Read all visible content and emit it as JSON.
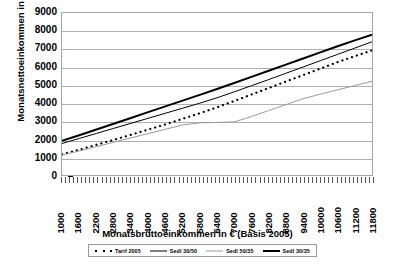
{
  "chart_data": {
    "type": "line",
    "title": "Monatsnettoeinkommen nach Tarifmodellen",
    "xlabel": "Monatsbruttoeinkommen in € (Basis 2005)",
    "ylabel": "Monatsnettoeinkommen in €",
    "ylim": [
      0,
      9000
    ],
    "ytick_step": 1000,
    "yticks": [
      9000,
      8000,
      7000,
      6000,
      5000,
      4000,
      3000,
      2000,
      1000,
      0
    ],
    "grid": true,
    "legend_position": "bottom",
    "categories": [
      1000,
      1600,
      2200,
      2800,
      3400,
      4000,
      4600,
      5200,
      5800,
      6400,
      7000,
      7600,
      8200,
      8800,
      9400,
      10000,
      10600,
      11200,
      11800
    ],
    "series": [
      {
        "name": "Tarif 2005",
        "style": "dotted",
        "color": "#000000",
        "values": [
          1150,
          1400,
          1680,
          1950,
          2230,
          2520,
          2810,
          3120,
          3430,
          3760,
          4110,
          4470,
          4830,
          5190,
          5550,
          5910,
          6270,
          6600,
          6920
        ]
      },
      {
        "name": "Sedl 30/50",
        "style": "solid-thin",
        "color": "#000000",
        "values": [
          1750,
          2030,
          2310,
          2590,
          2870,
          3150,
          3430,
          3710,
          3990,
          4290,
          4620,
          4960,
          5300,
          5650,
          6000,
          6350,
          6700,
          7050,
          7400
        ]
      },
      {
        "name": "Sedl 50/35",
        "style": "solid-gray",
        "color": "#9a9a9a",
        "values": [
          1100,
          1340,
          1580,
          1820,
          2060,
          2300,
          2540,
          2780,
          2900,
          2920,
          2950,
          3250,
          3580,
          3910,
          4240,
          4490,
          4730,
          4970,
          5200
        ]
      },
      {
        "name": "Sedl 30/35",
        "style": "solid-thick",
        "color": "#000000",
        "values": [
          1900,
          2210,
          2530,
          2850,
          3170,
          3490,
          3810,
          4130,
          4450,
          4780,
          5110,
          5450,
          5790,
          6130,
          6470,
          6810,
          7150,
          7480,
          7800
        ]
      }
    ]
  },
  "legend": {
    "items": [
      {
        "label": "Tarif 2005"
      },
      {
        "label": "Sedl 30/50"
      },
      {
        "label": "Sedl 50/35"
      },
      {
        "label": "Sedl 30/35"
      }
    ]
  }
}
